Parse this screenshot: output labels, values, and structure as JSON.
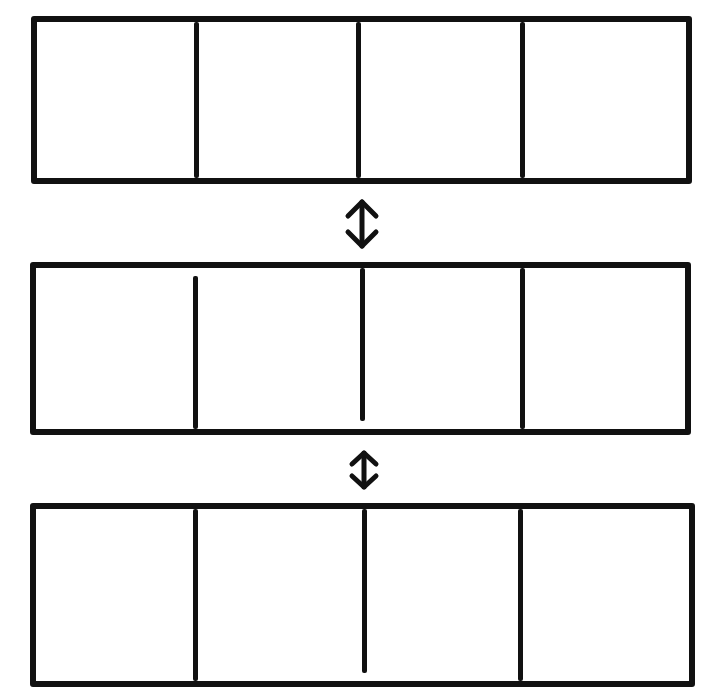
{
  "diagram": {
    "stroke_color": "#111111",
    "background_color": "#ffffff",
    "rows": [
      {
        "id": "row-1",
        "cells": [
          "",
          "",
          "",
          ""
        ]
      },
      {
        "id": "row-2",
        "cells": [
          "",
          "",
          "",
          ""
        ]
      },
      {
        "id": "row-3",
        "cells": [
          "",
          "",
          "",
          ""
        ]
      }
    ],
    "connectors": [
      {
        "from": "row-1",
        "to": "row-2",
        "icon": "double-headed-vertical-arrow"
      },
      {
        "from": "row-2",
        "to": "row-3",
        "icon": "double-headed-vertical-arrow"
      }
    ]
  }
}
